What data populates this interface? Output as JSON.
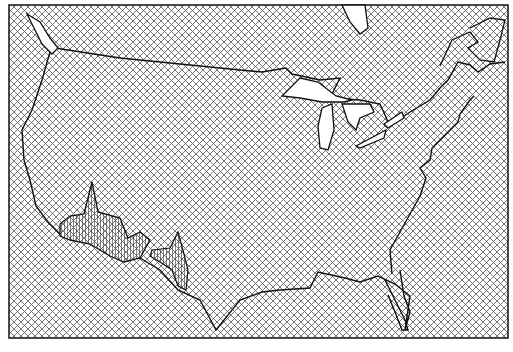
{
  "figure": {
    "type": "map",
    "region": "Contiguous United States",
    "fill_pattern": "crosshatch",
    "colors": {
      "line": "#111111",
      "hatch": "#555555",
      "background": "#ffffff"
    },
    "features": [
      "coastline",
      "Great Lakes",
      "Canada border",
      "Gulf of Mexico coast",
      "Florida peninsula"
    ],
    "highlighted_peaks": [
      {
        "name": "peak-southwest-1",
        "approx_px": [
          90,
          182
        ]
      },
      {
        "name": "peak-southwest-2",
        "approx_px": [
          180,
          232
        ]
      }
    ]
  }
}
